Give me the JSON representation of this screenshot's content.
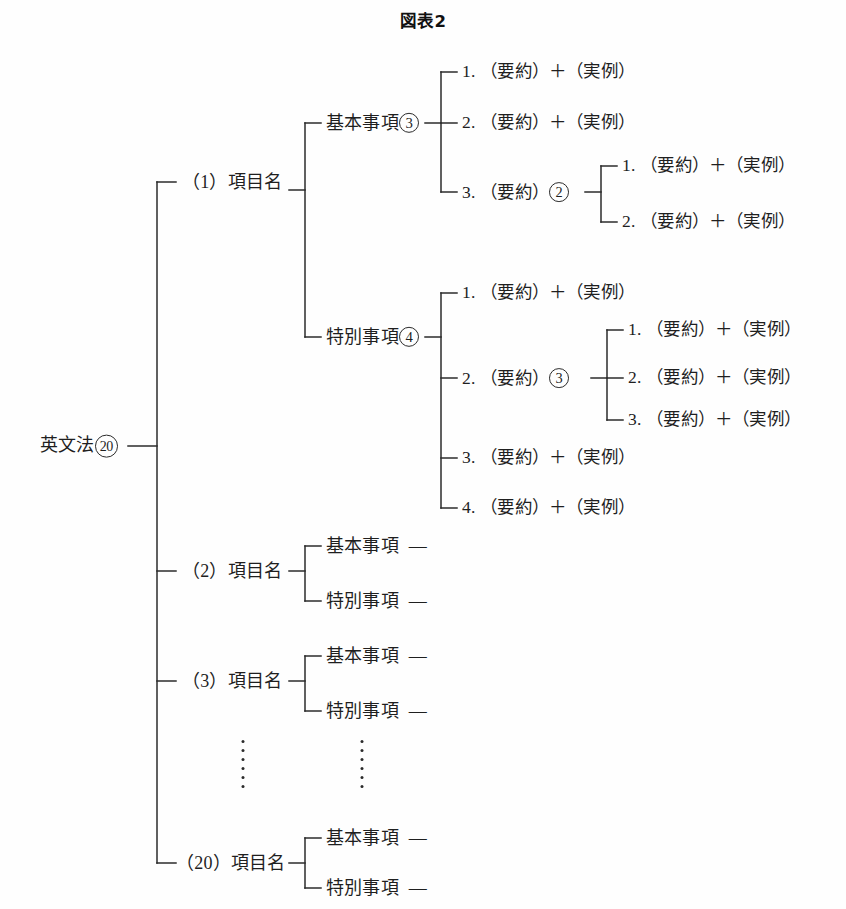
{
  "title": "図表2",
  "diagram": {
    "root": {
      "label": "英文法",
      "badge": "20"
    },
    "level1": [
      {
        "index": "（1）",
        "label": "項目名"
      },
      {
        "index": "（2）",
        "label": "項目名"
      },
      {
        "index": "（3）",
        "label": "項目名"
      },
      {
        "index": "（20）",
        "label": "項目名"
      }
    ],
    "g1_basic": {
      "label": "基本事項",
      "badge": "3"
    },
    "g1_special": {
      "label": "特別事項",
      "badge": "4"
    },
    "basic_items": [
      {
        "num": "1.",
        "text": "（要約）＋（実例）"
      },
      {
        "num": "2.",
        "text": "（要約）＋（実例）"
      },
      {
        "num": "3.",
        "text": "（要約）",
        "badge": "2"
      }
    ],
    "basic_sub": [
      {
        "num": "1.",
        "text": "（要約）＋（実例）"
      },
      {
        "num": "2.",
        "text": "（要約）＋（実例）"
      }
    ],
    "special_items": [
      {
        "num": "1.",
        "text": "（要約）＋（実例）"
      },
      {
        "num": "2.",
        "text": "（要約）",
        "badge": "3"
      },
      {
        "num": "3.",
        "text": "（要約）＋（実例）"
      },
      {
        "num": "4.",
        "text": "（要約）＋（実例）"
      }
    ],
    "special_sub": [
      {
        "num": "1.",
        "text": "（要約）＋（実例）"
      },
      {
        "num": "2.",
        "text": "（要約）＋（実例）"
      },
      {
        "num": "3.",
        "text": "（要約）＋（実例）"
      }
    ],
    "plain_groups": {
      "basic_label": "基本事項",
      "special_label": "特別事項",
      "dash": "—"
    },
    "ellipsis_dot_count": 6
  }
}
